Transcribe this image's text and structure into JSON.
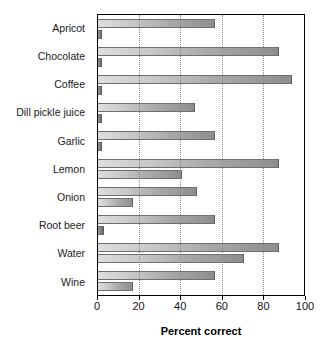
{
  "chart_data": {
    "type": "bar",
    "orientation": "horizontal",
    "title": "",
    "xlabel": "Percent correct",
    "ylabel": "",
    "xlim": [
      0,
      100
    ],
    "xticks": [
      0,
      20,
      40,
      60,
      80,
      100
    ],
    "xticklabels": [
      "0",
      "20",
      "40",
      "60",
      "80",
      "100"
    ],
    "gridlines": [
      20,
      40,
      60,
      80
    ],
    "grid": true,
    "legend": "none",
    "categories": [
      "Apricot",
      "Chocolate",
      "Coffee",
      "Dill pickle juice",
      "Garlic",
      "Lemon",
      "Onion",
      "Root beer",
      "Water",
      "Wine"
    ],
    "series": [
      {
        "name": "upper",
        "values": [
          57,
          88,
          94,
          47,
          57,
          88,
          48,
          57,
          88,
          57
        ]
      },
      {
        "name": "lower",
        "values": [
          2,
          2,
          2,
          2,
          2,
          41,
          17,
          3,
          71,
          17
        ]
      }
    ],
    "colors": {
      "bar_gradient_start": "#dedede",
      "bar_gradient_end": "#8e8e8e",
      "small_bar_start": "#9a9a9a",
      "small_bar_end": "#6a6a6a",
      "axis": "#000000",
      "gridline": "#8a8a8a",
      "text": "#111111",
      "background": "#ffffff"
    }
  }
}
